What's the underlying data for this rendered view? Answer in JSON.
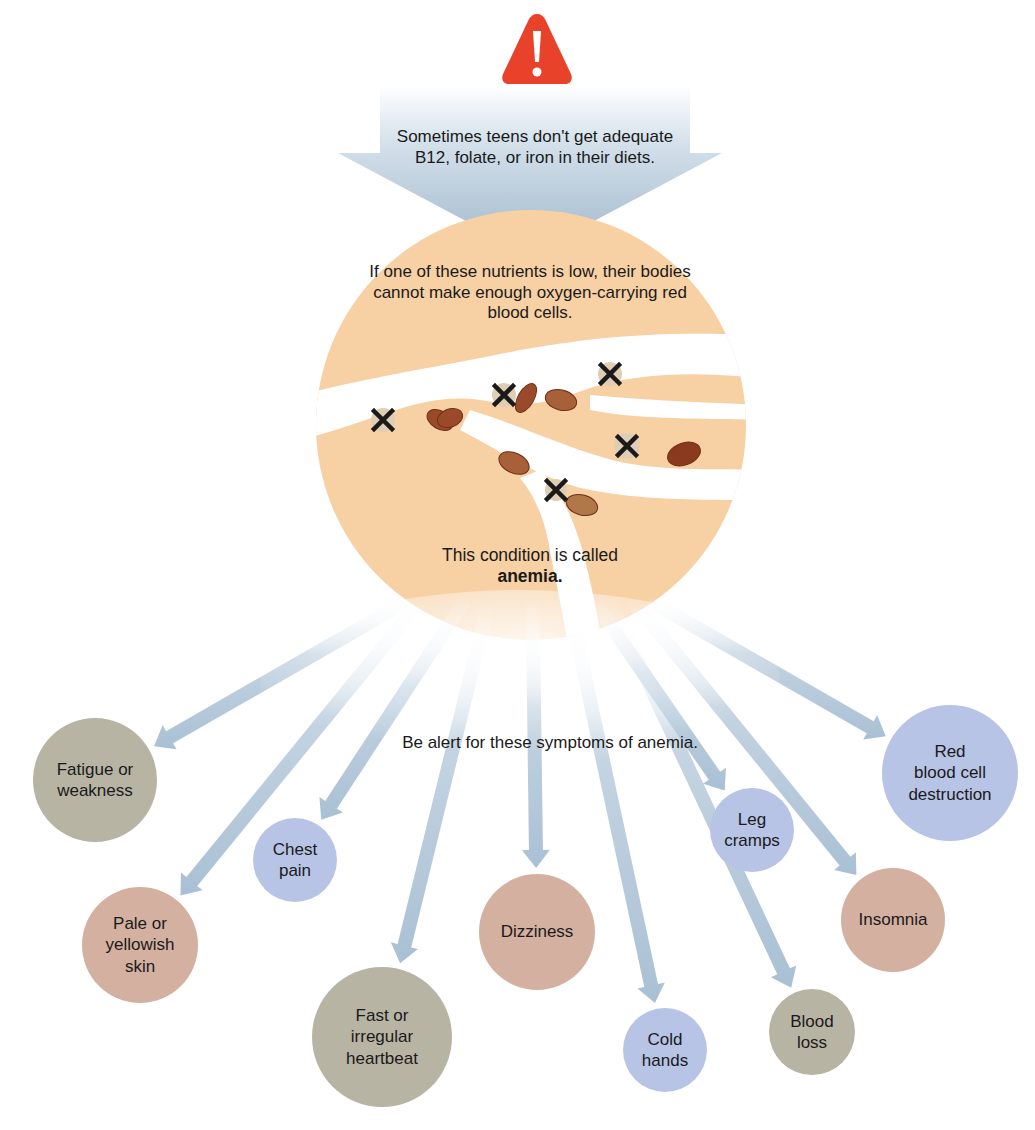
{
  "header": {
    "warning_icon": "warning-triangle-icon",
    "warning_color": "#e8432a",
    "intro_text": "Sometimes teens don't get adequate B12, folate, or iron in their diets."
  },
  "explanation": {
    "text": "If one of these nutrients is low, their bodies cannot make enough oxygen-carrying red blood cells.",
    "condition_prefix": "This condition is called",
    "condition_name": "anemia."
  },
  "symptoms_heading": "Be alert for these symptoms of anemia.",
  "colors": {
    "arrow_blue": "#a9c0d4",
    "orange_circle": "#f7d0a4",
    "gray_circle": "#b8b4a4",
    "pink_circle": "#d4b0a0",
    "blue_circle": "#b8c4e6",
    "rbc_brown": "#9a4a2a"
  },
  "symptoms": [
    {
      "label": "Fatigue or\nweakness",
      "color": "gray",
      "cx": 95,
      "cy": 780,
      "r": 62
    },
    {
      "label": "Pale or\nyellowish\nskin",
      "color": "pink",
      "cx": 140,
      "cy": 945,
      "r": 58
    },
    {
      "label": "Chest\npain",
      "color": "blue",
      "cx": 295,
      "cy": 860,
      "r": 42
    },
    {
      "label": "Fast or\nirregular\nheartbeat",
      "color": "gray",
      "cx": 382,
      "cy": 1037,
      "r": 70
    },
    {
      "label": "Dizziness",
      "color": "pink",
      "cx": 537,
      "cy": 932,
      "r": 58
    },
    {
      "label": "Cold\nhands",
      "color": "blue",
      "cx": 665,
      "cy": 1050,
      "r": 42
    },
    {
      "label": "Blood\nloss",
      "color": "gray",
      "cx": 812,
      "cy": 1032,
      "r": 43
    },
    {
      "label": "Leg\ncramps",
      "color": "blue",
      "cx": 752,
      "cy": 830,
      "r": 42
    },
    {
      "label": "Insomnia",
      "color": "pink",
      "cx": 893,
      "cy": 920,
      "r": 52
    },
    {
      "label": "Red\nblood cell\ndestruction",
      "color": "blue",
      "cx": 950,
      "cy": 773,
      "r": 68
    }
  ]
}
